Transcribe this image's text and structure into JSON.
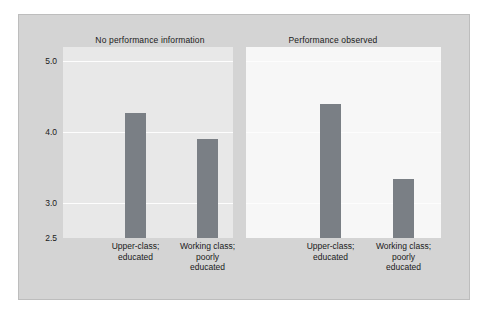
{
  "chart_data": {
    "type": "bar",
    "title": "",
    "subtitle": "",
    "xlabel": "",
    "ylabel": "",
    "ylim": [
      2.5,
      5.2
    ],
    "grid": true,
    "legend": "none",
    "panels": [
      {
        "label": "No performance information",
        "categories": [
          "Upper-class; educated",
          "Working class; poorly educated"
        ],
        "category_lines": [
          [
            "Upper-class;",
            "educated"
          ],
          [
            "Working class;",
            "poorly",
            "educated"
          ]
        ],
        "values": [
          4.27,
          3.9
        ]
      },
      {
        "label": "Performance observed",
        "categories": [
          "Upper-class; educated",
          "Working class; poorly educated"
        ],
        "category_lines": [
          [
            "Upper-class;",
            "educated"
          ],
          [
            "Working class;",
            "poorly",
            "educated"
          ]
        ],
        "values": [
          4.4,
          3.33
        ]
      }
    ],
    "yticks": [
      {
        "value": 5.0,
        "label": "5.0"
      },
      {
        "value": 4.0,
        "label": "4.0"
      },
      {
        "value": 3.0,
        "label": "3.0"
      },
      {
        "value": 2.5,
        "label": "2.5"
      }
    ],
    "colors": {
      "bar": "#7a7f85",
      "figure_background": "#d4d4d4",
      "panel_left_background": "#e8e8e8",
      "panel_right_background": "#f7f7f7",
      "gridline": "#fdfdfd",
      "text": "#1a1a1a"
    }
  }
}
